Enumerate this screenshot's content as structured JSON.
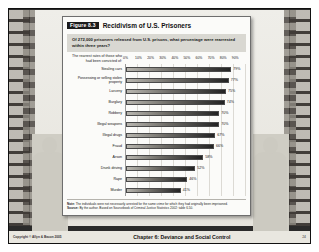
{
  "figure": {
    "badge": "Figure 8.3",
    "title": "Recidivism of U.S. Prisoners",
    "question": "Of 272,000 prisoners released from U.S. prisons, what percentage were rearrested within three years?",
    "y_axis_heading": "The rearrest rates of those who had been convicted of:",
    "note_label": "Note:",
    "note_text": "The individuals were not necessarily arrested for the same crime for which they had originally been imprisoned.",
    "source_label": "Source:",
    "source_text": "By the author. Based on Sourcebook of Criminal Justice Statistics 2002: table 6.50."
  },
  "footer": {
    "copyright": "Copyright © Allyn & Bacon 2005",
    "center": "Chapter 6: Deviance and Social Control",
    "page": "24"
  },
  "chart_data": {
    "type": "bar",
    "orientation": "horizontal",
    "title": "Recidivism of U.S. Prisoners",
    "subtitle": "Of 272,000 prisoners released from U.S. prisons, what percentage were rearrested within three years?",
    "xlabel": "",
    "ylabel": "The rearrest rates of those who had been convicted of:",
    "xlim": [
      0,
      90
    ],
    "grid": true,
    "legend": false,
    "tick_labels": [
      "0%",
      "10%",
      "20%",
      "30%",
      "40%",
      "50%",
      "60%",
      "70%",
      "80%",
      "90%"
    ],
    "categories": [
      "Stealing cars",
      "Possessing or selling stolen property",
      "Larceny",
      "Burglary",
      "Robbery",
      "Illegal weapons",
      "Illegal drugs",
      "Fraud",
      "Arson",
      "Drunk driving",
      "Rape",
      "Murder"
    ],
    "values": [
      79,
      77,
      75,
      74,
      70,
      70,
      67,
      66,
      58,
      52,
      46,
      41
    ],
    "value_labels": [
      "79%",
      "77%",
      "75%",
      "74%",
      "70%",
      "70%",
      "67%",
      "66%",
      "58%",
      "52%",
      "46%",
      "41%"
    ]
  }
}
